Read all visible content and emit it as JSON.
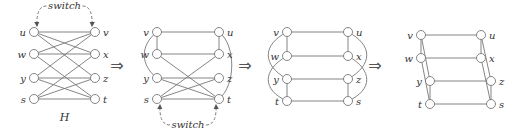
{
  "diagram": {
    "colors": {
      "stroke": "#777777",
      "node_fill": "#ffffff",
      "text": "#333333"
    },
    "implies_symbol": "⇒",
    "graphs": [
      {
        "id": "H",
        "caption": "H",
        "annotation": {
          "text": "switch",
          "position": "top"
        },
        "nodes": [
          {
            "id": "u",
            "x": 34,
            "y": 32,
            "side": "left"
          },
          {
            "id": "w",
            "x": 34,
            "y": 54,
            "side": "left"
          },
          {
            "id": "y",
            "x": 34,
            "y": 78,
            "side": "left"
          },
          {
            "id": "s",
            "x": 34,
            "y": 99,
            "side": "left"
          },
          {
            "id": "v",
            "x": 95,
            "y": 32,
            "side": "right"
          },
          {
            "id": "x",
            "x": 95,
            "y": 54,
            "side": "right"
          },
          {
            "id": "z",
            "x": 95,
            "y": 78,
            "side": "right"
          },
          {
            "id": "t",
            "x": 95,
            "y": 99,
            "side": "right"
          }
        ],
        "edges": [
          [
            "u",
            "v"
          ],
          [
            "u",
            "x"
          ],
          [
            "u",
            "z"
          ],
          [
            "w",
            "v"
          ],
          [
            "w",
            "x"
          ],
          [
            "w",
            "t"
          ],
          [
            "y",
            "v"
          ],
          [
            "y",
            "z"
          ],
          [
            "y",
            "t"
          ],
          [
            "s",
            "x"
          ],
          [
            "s",
            "z"
          ],
          [
            "s",
            "t"
          ]
        ],
        "curves": []
      },
      {
        "id": "G2",
        "caption": "",
        "annotation": {
          "text": "switch",
          "position": "bottom"
        },
        "nodes": [
          {
            "id": "v",
            "x": 157,
            "y": 32,
            "side": "left"
          },
          {
            "id": "w",
            "x": 157,
            "y": 54,
            "side": "left"
          },
          {
            "id": "y",
            "x": 157,
            "y": 78,
            "side": "left"
          },
          {
            "id": "s",
            "x": 157,
            "y": 99,
            "side": "left"
          },
          {
            "id": "u",
            "x": 219,
            "y": 32,
            "side": "right"
          },
          {
            "id": "x",
            "x": 219,
            "y": 54,
            "side": "right"
          },
          {
            "id": "z",
            "x": 219,
            "y": 78,
            "side": "right"
          },
          {
            "id": "t",
            "x": 219,
            "y": 99,
            "side": "right"
          }
        ],
        "edges": [
          [
            "v",
            "u"
          ],
          [
            "v",
            "w"
          ],
          [
            "w",
            "x"
          ],
          [
            "u",
            "x"
          ],
          [
            "w",
            "t"
          ],
          [
            "y",
            "z"
          ],
          [
            "y",
            "t"
          ],
          [
            "s",
            "x"
          ],
          [
            "s",
            "z"
          ],
          [
            "s",
            "t"
          ]
        ],
        "curves": [
          {
            "d": "M157,32 C140,45 140,65 157,78"
          },
          {
            "d": "M219,32 C236,45 236,85 219,99"
          }
        ]
      },
      {
        "id": "G3",
        "caption": "",
        "annotation": null,
        "nodes": [
          {
            "id": "v",
            "x": 287,
            "y": 32,
            "side": "left"
          },
          {
            "id": "w",
            "x": 287,
            "y": 56,
            "side": "left"
          },
          {
            "id": "y",
            "x": 287,
            "y": 79,
            "side": "left"
          },
          {
            "id": "t",
            "x": 287,
            "y": 101,
            "side": "left"
          },
          {
            "id": "u",
            "x": 348,
            "y": 32,
            "side": "right"
          },
          {
            "id": "x",
            "x": 348,
            "y": 56,
            "side": "right"
          },
          {
            "id": "z",
            "x": 348,
            "y": 79,
            "side": "right"
          },
          {
            "id": "s",
            "x": 348,
            "y": 101,
            "side": "right"
          }
        ],
        "edges": [
          [
            "v",
            "u"
          ],
          [
            "v",
            "w"
          ],
          [
            "w",
            "x"
          ],
          [
            "u",
            "x"
          ],
          [
            "y",
            "z"
          ],
          [
            "y",
            "t"
          ],
          [
            "t",
            "s"
          ],
          [
            "z",
            "s"
          ]
        ],
        "curves": [
          {
            "d": "M287,32 C262,45 262,65 287,79"
          },
          {
            "d": "M287,56 C262,70 262,90 287,101"
          },
          {
            "d": "M348,32 C373,45 373,65 348,79"
          },
          {
            "d": "M348,56 C373,70 373,90 348,101"
          }
        ]
      },
      {
        "id": "G4",
        "caption": "",
        "annotation": null,
        "nodes": [
          {
            "id": "v",
            "x": 421,
            "y": 35,
            "side": "left"
          },
          {
            "id": "w",
            "x": 421,
            "y": 58,
            "side": "left"
          },
          {
            "id": "y",
            "x": 430,
            "y": 81,
            "side": "left"
          },
          {
            "id": "t",
            "x": 430,
            "y": 104,
            "side": "left"
          },
          {
            "id": "u",
            "x": 481,
            "y": 35,
            "side": "right"
          },
          {
            "id": "x",
            "x": 481,
            "y": 58,
            "side": "right"
          },
          {
            "id": "z",
            "x": 491,
            "y": 81,
            "side": "right"
          },
          {
            "id": "s",
            "x": 491,
            "y": 104,
            "side": "right"
          }
        ],
        "edges": [
          [
            "v",
            "u"
          ],
          [
            "w",
            "x"
          ],
          [
            "y",
            "z"
          ],
          [
            "t",
            "s"
          ],
          [
            "v",
            "w"
          ],
          [
            "u",
            "x"
          ],
          [
            "v",
            "y"
          ],
          [
            "w",
            "t"
          ],
          [
            "y",
            "t"
          ],
          [
            "u",
            "z"
          ],
          [
            "x",
            "s"
          ],
          [
            "z",
            "s"
          ]
        ],
        "curves": []
      }
    ],
    "arrows": [
      {
        "x": 117,
        "y": 66
      },
      {
        "x": 245,
        "y": 66
      },
      {
        "x": 375,
        "y": 66
      }
    ]
  }
}
